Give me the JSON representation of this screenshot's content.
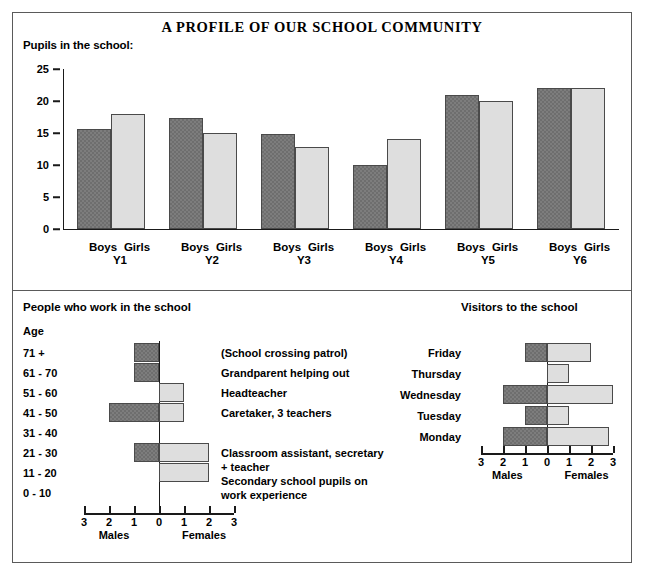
{
  "poster": {
    "title": "A PROFILE OF OUR SCHOOL COMMUNITY",
    "pupils_label": "Pupils in the school:",
    "workers_title": "People who work in the school",
    "visitors_title": "Visitors to the school",
    "age_heading": "Age"
  },
  "chart_data": [
    {
      "type": "bar",
      "title": "Pupils in the school:",
      "xlabel": "",
      "ylabel": "",
      "ylim": [
        0,
        25
      ],
      "yticks": [
        0,
        5,
        10,
        15,
        20,
        25
      ],
      "grid": false,
      "legend": "none",
      "categories": [
        "Y1",
        "Y2",
        "Y3",
        "Y4",
        "Y5",
        "Y6"
      ],
      "group_labels": [
        "Boys",
        "Girls"
      ],
      "series": [
        {
          "name": "Boys",
          "values": [
            15.7,
            17.4,
            14.9,
            10.0,
            21.0,
            22.0
          ],
          "color": "#6e6e6e"
        },
        {
          "name": "Girls",
          "values": [
            18.0,
            15.0,
            12.8,
            14.0,
            20.0,
            22.0
          ],
          "color": "#dedede"
        }
      ]
    },
    {
      "type": "bar",
      "title": "People who work in the school",
      "orientation": "population-pyramid",
      "xlabel_left": "Males",
      "xlabel_right": "Females",
      "xticks": [
        "3",
        "2",
        "1",
        "0",
        "1",
        "2",
        "3"
      ],
      "xlim": [
        -3,
        3
      ],
      "ylabel": "Age",
      "categories": [
        "71 +",
        "61 - 70",
        "51 - 60",
        "41 - 50",
        "31 - 40",
        "21 - 30",
        "11 - 20",
        "0 - 10"
      ],
      "series": [
        {
          "name": "Males",
          "values": [
            1,
            1,
            0,
            2,
            0,
            1,
            0,
            0
          ],
          "color": "#6e6e6e"
        },
        {
          "name": "Females",
          "values": [
            0,
            0,
            1,
            1,
            0,
            2,
            2,
            0
          ],
          "color": "#dedede"
        }
      ],
      "annotations": [
        {
          "row": "71 +",
          "text": "(School crossing patrol)"
        },
        {
          "row": "61 - 70",
          "text": "Grandparent helping out"
        },
        {
          "row": "51 - 60",
          "text": "Headteacher"
        },
        {
          "row": "41 - 50",
          "text": "Caretaker, 3 teachers"
        },
        {
          "row": "21 - 30",
          "text": "Classroom assistant, secretary"
        },
        {
          "row": "21 - 30b",
          "text": "+ teacher"
        },
        {
          "row": "11 - 20",
          "text": "Secondary school pupils on"
        },
        {
          "row": "11 - 20b",
          "text": "work experience"
        }
      ]
    },
    {
      "type": "bar",
      "title": "Visitors to the school",
      "orientation": "population-pyramid",
      "xlabel_left": "Males",
      "xlabel_right": "Females",
      "xticks": [
        "3",
        "2",
        "1",
        "0",
        "1",
        "2",
        "3"
      ],
      "xlim": [
        -3,
        3
      ],
      "categories": [
        "Friday",
        "Thursday",
        "Wednesday",
        "Tuesday",
        "Monday"
      ],
      "series": [
        {
          "name": "Males",
          "values": [
            1,
            0,
            2,
            1,
            2
          ],
          "color": "#6e6e6e"
        },
        {
          "name": "Females",
          "values": [
            2,
            1,
            3,
            1,
            2.8
          ],
          "color": "#dedede"
        }
      ]
    }
  ],
  "colors": {
    "male_bar": "#6e6e6e",
    "female_bar": "#dedede",
    "border": "#5a5a5a",
    "axis": "#1a1a1a"
  }
}
